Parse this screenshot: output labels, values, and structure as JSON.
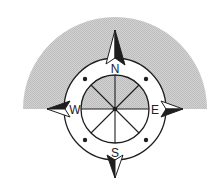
{
  "figure": {
    "type": "compass-rose",
    "colors": {
      "shade": "#c8c8c8",
      "line": "#1e1e1e",
      "background": "#ffffff"
    },
    "labels": {
      "north": "N",
      "east": "E",
      "south": "S",
      "west": "W"
    },
    "spokes": 8,
    "dots": 4
  }
}
